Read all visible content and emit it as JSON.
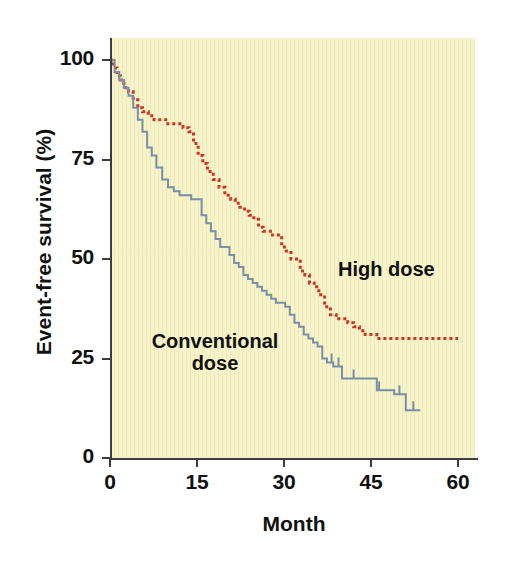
{
  "figure": {
    "background_color": "#ffffff",
    "panel_color": "#f6f3c9"
  },
  "chart_data": {
    "type": "line",
    "title": "",
    "subtitle": "",
    "xlabel": "Month",
    "ylabel": "Event-free survival (%)",
    "xlim": [
      0,
      63
    ],
    "ylim": [
      0,
      105
    ],
    "xticks": [
      0,
      15,
      30,
      45,
      60
    ],
    "xtick_labels": [
      "0",
      "15",
      "30",
      "45",
      "60"
    ],
    "yticks": [
      0,
      25,
      50,
      75,
      100
    ],
    "ytick_labels": [
      "0",
      "25",
      "50",
      "75",
      "100"
    ],
    "grid": false,
    "legend_position": "inline-annotation",
    "plot_style": "kaplan-meier step curves",
    "annotations": [
      {
        "text": "High dose",
        "x": 46,
        "y": 43,
        "color": "#111111"
      },
      {
        "text": "Conventional dose",
        "x": 13,
        "y": 24,
        "color": "#111111"
      }
    ],
    "series": [
      {
        "name": "High dose",
        "color": "#cc3322",
        "linestyle": "dotted",
        "linewidth": 3,
        "step": "post",
        "x": [
          0,
          0.6,
          1.2,
          1.8,
          2.4,
          3.2,
          4.0,
          4.8,
          5.6,
          6.6,
          7.6,
          8.6,
          9.6,
          10.6,
          11.6,
          12.6,
          13.6,
          14.4,
          15.2,
          16.0,
          16.8,
          17.8,
          18.8,
          19.8,
          20.8,
          21.6,
          22.4,
          23.2,
          24.0,
          24.8,
          25.6,
          26.4,
          27.2,
          28.0,
          28.8,
          29.6,
          30.4,
          31.2,
          32.0,
          32.8,
          33.6,
          34.4,
          35.2,
          36.0,
          37.0,
          38.0,
          39.0,
          40.0,
          41.0,
          42.0,
          43.0,
          44.0,
          46.0,
          50.0,
          55.0,
          60.0
        ],
        "y": [
          100,
          98,
          96,
          95,
          93,
          92,
          90,
          88,
          87,
          86,
          85,
          85,
          84,
          84,
          84,
          83,
          82,
          79,
          76,
          74,
          72,
          70,
          68,
          66,
          65,
          64,
          63,
          62,
          61,
          60,
          58,
          57,
          57,
          56,
          56,
          53,
          52,
          50,
          50,
          47,
          46,
          44,
          43,
          41,
          38,
          36,
          35,
          35,
          34,
          33,
          32,
          31,
          30,
          30,
          30,
          30
        ]
      },
      {
        "name": "Conventional dose",
        "color": "#7a8fa6",
        "linestyle": "solid",
        "linewidth": 2,
        "step": "post",
        "x": [
          0,
          0.8,
          1.6,
          2.4,
          3.2,
          4.0,
          4.8,
          5.6,
          6.4,
          7.2,
          8.0,
          9.0,
          10.0,
          11.0,
          12.0,
          13.0,
          14.0,
          15.0,
          15.8,
          16.6,
          17.4,
          18.2,
          19.0,
          19.8,
          20.6,
          21.4,
          22.2,
          23.0,
          23.8,
          24.6,
          25.4,
          26.2,
          27.0,
          27.8,
          28.6,
          29.4,
          30.2,
          31.0,
          31.8,
          32.6,
          33.4,
          34.2,
          35.0,
          35.8,
          36.6,
          37.4,
          38.5,
          40.0,
          41.5,
          43.0,
          44.5,
          46.0,
          47.5,
          49.0,
          51.0,
          53.5
        ],
        "y": [
          100,
          97,
          95,
          93,
          91,
          88,
          85,
          82,
          78,
          76,
          73,
          70,
          68,
          67,
          66,
          66,
          65,
          65,
          61,
          59,
          57,
          55,
          53,
          53,
          51,
          49,
          48,
          46,
          45,
          44,
          43,
          42,
          41,
          40,
          39,
          39,
          38,
          36,
          34,
          33,
          31,
          30,
          29,
          28,
          25,
          24,
          23,
          20,
          20,
          20,
          20,
          17,
          17,
          16,
          12,
          12
        ]
      }
    ],
    "censor_marks": {
      "conventional_dose_x": [
        38.2,
        39.4,
        42.0,
        46.4,
        49.9,
        52.3
      ],
      "high_dose_x": []
    }
  },
  "axes": {
    "x_title": "Month",
    "y_title": "Event-free survival (%)"
  }
}
